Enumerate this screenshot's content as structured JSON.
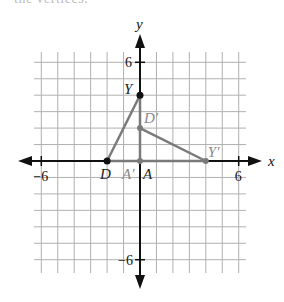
{
  "header": {
    "cutoff_text": "the vertices."
  },
  "chart_data": {
    "type": "scatter",
    "title": "",
    "xlabel": "x",
    "ylabel": "y",
    "xlim": [
      -6.5,
      6.5
    ],
    "ylim": [
      -6.8,
      6.6
    ],
    "grid": true,
    "tick_labels": {
      "x": [
        {
          "value": -6,
          "label": "−6"
        },
        {
          "value": 6,
          "label": "6"
        }
      ],
      "y": [
        {
          "value": 6,
          "label": "6"
        },
        {
          "value": -6,
          "label": "−6"
        }
      ]
    },
    "points": [
      {
        "name": "D",
        "label": "D",
        "x": -2,
        "y": 0
      },
      {
        "name": "Y",
        "label": "Y",
        "x": 0,
        "y": 4
      },
      {
        "name": "A",
        "label": "A",
        "x": 0,
        "y": 0
      },
      {
        "name": "D'",
        "label": "D′",
        "x": 0,
        "y": 2
      },
      {
        "name": "Y'",
        "label": "Y′",
        "x": 4,
        "y": 0
      },
      {
        "name": "A'",
        "label": "A′",
        "x": 0,
        "y": 0
      }
    ],
    "segments": [
      {
        "from": "D",
        "to": "Y",
        "color": "#7a7a7a"
      },
      {
        "from": "Y",
        "to": "A",
        "color": "#7a7a7a"
      },
      {
        "from": "D",
        "to": "A",
        "color": "#7a7a7a"
      },
      {
        "from": "D'",
        "to": "Y'",
        "color": "#7a7a7a"
      },
      {
        "from": "A'",
        "to": "Y'",
        "color": "#7a7a7a"
      }
    ],
    "triangles": [
      {
        "name": "DYA",
        "vertices": [
          "D",
          "Y",
          "A"
        ]
      },
      {
        "name": "D'Y'A'",
        "vertices": [
          "D'",
          "Y'",
          "A'"
        ]
      }
    ]
  },
  "colors": {
    "axis": "#111111",
    "grid": "#b0b0b0",
    "segment": "#7a7a7a",
    "point_original": "#111111",
    "point_image": "#7a7a7a",
    "label_original": "#222222",
    "label_image": "#8a8a8a"
  }
}
